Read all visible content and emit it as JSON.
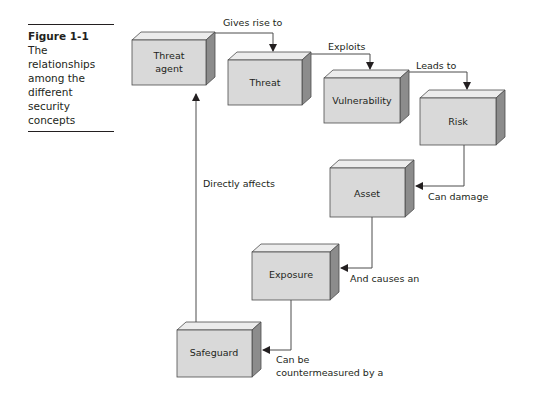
{
  "figure": {
    "number": "Figure 1-1",
    "caption": "The relationships among the different security concepts",
    "caption_lines": [
      "The relationships",
      "among the",
      "different security",
      "concepts"
    ]
  },
  "nodes": [
    {
      "id": "threat-agent",
      "lines": [
        "Threat",
        "agent"
      ]
    },
    {
      "id": "threat",
      "lines": [
        "Threat"
      ]
    },
    {
      "id": "vulnerability",
      "lines": [
        "Vulnerability"
      ]
    },
    {
      "id": "risk",
      "lines": [
        "Risk"
      ]
    },
    {
      "id": "asset",
      "lines": [
        "Asset"
      ]
    },
    {
      "id": "exposure",
      "lines": [
        "Exposure"
      ]
    },
    {
      "id": "safeguard",
      "lines": [
        "Safeguard"
      ]
    }
  ],
  "edges": [
    {
      "from": "threat-agent",
      "to": "threat",
      "label": "Gives rise to"
    },
    {
      "from": "threat",
      "to": "vulnerability",
      "label": "Exploits"
    },
    {
      "from": "vulnerability",
      "to": "risk",
      "label": "Leads to"
    },
    {
      "from": "risk",
      "to": "asset",
      "label": "Can damage"
    },
    {
      "from": "asset",
      "to": "exposure",
      "label": "And causes an"
    },
    {
      "from": "exposure",
      "to": "safeguard",
      "label": "Can be countermeasured by a",
      "label_lines": [
        "Can be",
        "countermeasured by a"
      ]
    },
    {
      "from": "safeguard",
      "to": "threat-agent",
      "label": "Directly affects"
    }
  ],
  "colors": {
    "box_front": "#d9d9d9",
    "box_top": "#ececec",
    "box_side": "#8c8c8c",
    "stroke": "#4d4d4d",
    "text": "#231f20"
  }
}
